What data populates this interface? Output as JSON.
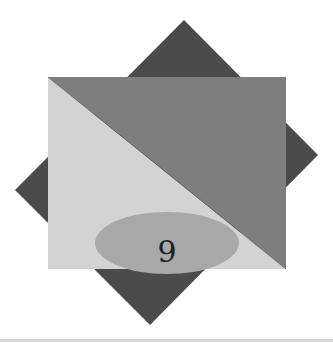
{
  "figure": {
    "label": "9",
    "colors": {
      "background": "#ffffff",
      "diamond": "#4b4b4b",
      "upper_triangle": "#7e7e7e",
      "lower_triangle": "#d3d3d3",
      "ellipse": "#a8a8a8",
      "label": "#222222",
      "bottom_rule": "#d6d6d6"
    }
  }
}
